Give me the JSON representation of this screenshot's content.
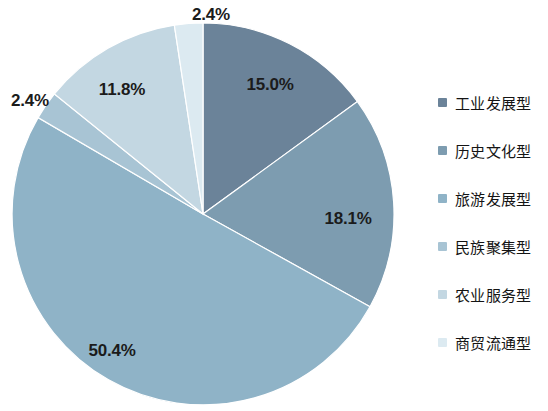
{
  "chart_data": {
    "type": "pie",
    "title": "",
    "categories": [
      "工业发展型",
      "历史文化型",
      "旅游发展型",
      "民族聚集型",
      "农业服务型",
      "商贸流通型"
    ],
    "values": [
      15.0,
      18.1,
      50.4,
      2.4,
      11.8,
      2.4
    ],
    "value_labels": [
      "15.0%",
      "18.1%",
      "50.4%",
      "2.4%",
      "11.8%",
      "2.4%"
    ],
    "colors": [
      "#6b8399",
      "#7d9cb0",
      "#8fb3c7",
      "#a8c4d4",
      "#c3d7e2",
      "#dceaf1"
    ],
    "legend_position": "right",
    "start_angle": 0,
    "direction": "clockwise",
    "grid": false,
    "xlabel": "",
    "ylabel": "",
    "slices": [
      {
        "label": "工业发展型",
        "value": 15.0,
        "display": "15.0%",
        "color": "#6b8399",
        "label_x": 270,
        "label_y": 85
      },
      {
        "label": "历史文化型",
        "value": 18.1,
        "display": "18.1%",
        "color": "#7d9cb0",
        "label_x": 348,
        "label_y": 219
      },
      {
        "label": "旅游发展型",
        "value": 50.4,
        "display": "50.4%",
        "color": "#8fb3c7",
        "label_x": 112,
        "label_y": 351
      },
      {
        "label": "民族聚集型",
        "value": 2.4,
        "display": "2.4%",
        "color": "#a8c4d4",
        "label_x": 30,
        "label_y": 101
      },
      {
        "label": "农业服务型",
        "value": 11.8,
        "display": "11.8%",
        "color": "#c3d7e2",
        "label_x": 122,
        "label_y": 90
      },
      {
        "label": "商贸流通型",
        "value": 2.4,
        "display": "2.4%",
        "color": "#dceaf1",
        "label_x": 211,
        "label_y": 15
      }
    ]
  },
  "legend": {
    "items": [
      {
        "label": "工业发展型",
        "color": "#6b8399"
      },
      {
        "label": "历史文化型",
        "color": "#7d9cb0"
      },
      {
        "label": "旅游发展型",
        "color": "#8fb3c7"
      },
      {
        "label": "民族聚集型",
        "color": "#a8c4d4"
      },
      {
        "label": "农业服务型",
        "color": "#c3d7e2"
      },
      {
        "label": "商贸流通型",
        "color": "#dceaf1"
      }
    ]
  }
}
